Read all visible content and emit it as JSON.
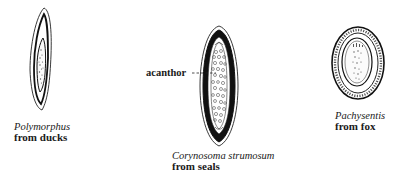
{
  "figure": {
    "specimens": [
      {
        "id": "polymorphus",
        "species": "Polymorphus",
        "host": "from ducks",
        "shape": "elongated-spindle"
      },
      {
        "id": "corynosoma",
        "species": "Corynosoma strumosum",
        "host": "from seals",
        "shape": "fusiform-thick-shell"
      },
      {
        "id": "pachysentis",
        "species": "Pachysentis",
        "host": "from fox",
        "shape": "oval"
      }
    ],
    "labels": {
      "acanthor": "acanthor"
    },
    "colors": {
      "ink": "#111111",
      "background": "#ffffff"
    }
  }
}
